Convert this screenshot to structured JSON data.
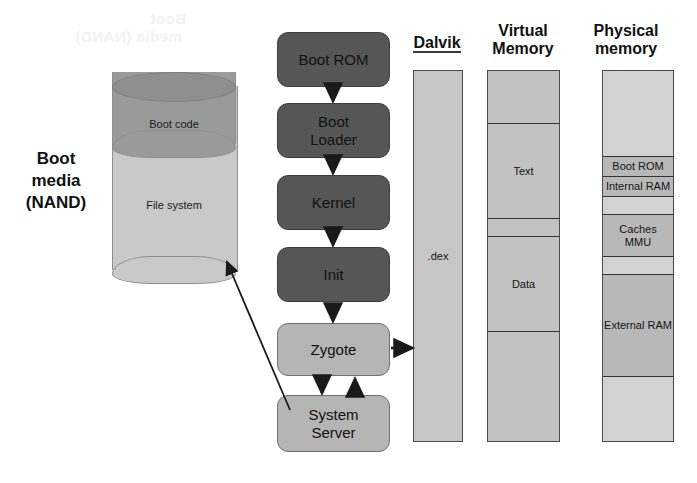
{
  "artifact": {
    "ghost_line1": "Boot",
    "ghost_line2": "media (NAND)"
  },
  "boot_media": {
    "caption_line1": "Boot",
    "caption_line2": "media",
    "caption_line3": "(NAND)",
    "top_segment_label": "Boot code",
    "body_segment_label": "File system",
    "colors": {
      "boot_code_fill": "#9a9a9a",
      "file_system_fill": "#c9c9c9",
      "outline": "#8e8e8e"
    }
  },
  "boot_flow": {
    "steps": [
      {
        "label": "Boot ROM",
        "style": "dark"
      },
      {
        "label": "Boot\nLoader",
        "style": "dark"
      },
      {
        "label": "Kernel",
        "style": "dark"
      },
      {
        "label": "Init",
        "style": "dark"
      },
      {
        "label": "Zygote",
        "style": "light"
      },
      {
        "label": "System\nServer",
        "style": "light"
      }
    ],
    "colors": {
      "dark_fill": "#565656",
      "light_fill": "#b5b5b5",
      "arrow": "#1a1a1a"
    }
  },
  "columns": {
    "dalvik": {
      "header": "Dalvik",
      "header_underlined": true,
      "segments": [
        {
          "label": ".dex",
          "fill": "#c6c6c6"
        }
      ]
    },
    "virtual_memory": {
      "header_line1": "Virtual",
      "header_line2": "Memory",
      "segments": [
        {
          "label": "",
          "fill": "#c2c2c2"
        },
        {
          "label": "Text",
          "fill": "#c2c2c2"
        },
        {
          "label": "",
          "fill": "#c2c2c2"
        },
        {
          "label": "Data",
          "fill": "#c2c2c2"
        },
        {
          "label": "",
          "fill": "#c2c2c2"
        }
      ]
    },
    "physical_memory": {
      "header_line1": "Physical",
      "header_line2": "memory",
      "segments": [
        {
          "label": "",
          "fill": "#d2d2d2"
        },
        {
          "label": "Boot ROM",
          "fill": "#b8b8b8"
        },
        {
          "label": "Internal RAM",
          "fill": "#b8b8b8"
        },
        {
          "label": "",
          "fill": "#d2d2d2"
        },
        {
          "label": "Caches\nMMU",
          "fill": "#b8b8b8"
        },
        {
          "label": "",
          "fill": "#d2d2d2"
        },
        {
          "label": "External RAM",
          "fill": "#b8b8b8"
        },
        {
          "label": "",
          "fill": "#d2d2d2"
        }
      ]
    }
  }
}
